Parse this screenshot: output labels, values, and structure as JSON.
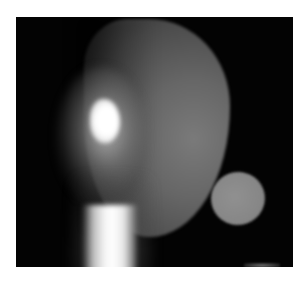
{
  "image": {
    "description": "Grayscale scintigraphy-style image: head silhouette with bright focal hotspot, bright neck column, and separate circular reference disc",
    "colors": {
      "background": "#ffffff",
      "frame": "#030303",
      "head": "#6a6a6a",
      "hotspot": "#ffffff",
      "disc": "#888888"
    },
    "regions": [
      {
        "name": "head-silhouette",
        "shape": "rounded",
        "tone": "mid-gray"
      },
      {
        "name": "focal-hotspot",
        "shape": "oval",
        "tone": "white"
      },
      {
        "name": "neck-column",
        "shape": "vertical-band",
        "tone": "white"
      },
      {
        "name": "reference-disc",
        "shape": "ellipse",
        "tone": "gray"
      }
    ]
  }
}
